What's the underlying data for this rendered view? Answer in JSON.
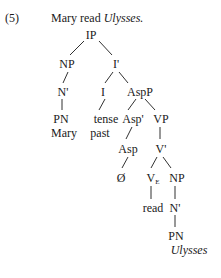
{
  "example": {
    "number": "(5)",
    "sentence_plain": "Mary read ",
    "sentence_italic": "Ulysses."
  },
  "tree": {
    "nodes": {
      "ip": "IP",
      "np_subj": "NP",
      "i_bar": "I'",
      "n_bar_subj": "N'",
      "i_head": "I",
      "aspp": "AspP",
      "pn_subj": "PN",
      "mary": "Mary",
      "tense": "tense",
      "past": "past",
      "asp_bar": "Asp'",
      "vp": "VP",
      "asp_head": "Asp",
      "v_bar": "V'",
      "null": "Ø",
      "v_head": "V",
      "v_subscript": "E",
      "np_obj": "NP",
      "read": "read",
      "n_bar_obj": "N'",
      "pn_obj": "PN",
      "ulysses": "Ulysses"
    },
    "edges": [
      [
        "IP",
        "NP"
      ],
      [
        "IP",
        "I'"
      ],
      [
        "NP",
        "N'"
      ],
      [
        "I'",
        "I"
      ],
      [
        "I'",
        "AspP"
      ],
      [
        "N'",
        "PN"
      ],
      [
        "I",
        "tense"
      ],
      [
        "AspP",
        "Asp'"
      ],
      [
        "AspP",
        "VP"
      ],
      [
        "Asp'",
        "Asp"
      ],
      [
        "VP",
        "V'"
      ],
      [
        "Asp",
        "Ø"
      ],
      [
        "V'",
        "V_E"
      ],
      [
        "V'",
        "NP"
      ],
      [
        "V_E",
        "read"
      ],
      [
        "NP",
        "N'"
      ],
      [
        "N'",
        "PN"
      ]
    ]
  }
}
